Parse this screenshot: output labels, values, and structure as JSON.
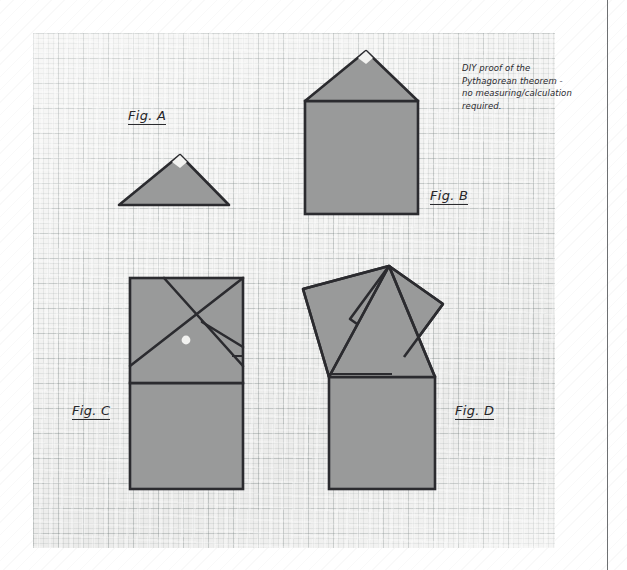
{
  "page": {
    "title": "DIY proof of the Pythagorean theorem",
    "medium": "graph paper sketch",
    "paper_color": "#f3f3f2",
    "ink_color": "#26262a",
    "shape_fill": "#999a9a",
    "shape_stroke": "#2b2b2f"
  },
  "note": {
    "line1": "DIY proof of the",
    "line2": "Pythagorean theorem -",
    "line3": "no measuring/calculation",
    "line4": "required."
  },
  "figures": [
    {
      "id": "A",
      "label": "Fig. A",
      "caption": "right triangle",
      "description": "A single right triangle with a small square right-angle marker at its apex.",
      "label_x": 128,
      "label_y": 108
    },
    {
      "id": "B",
      "label": "Fig. B",
      "caption": "square on the hypotenuse",
      "description": "The same right triangle sitting on top of a square drawn on its hypotenuse, forming a house shape.",
      "label_x": 430,
      "label_y": 188
    },
    {
      "id": "C",
      "label": "Fig. C",
      "caption": "four copies tiling the hypotenuse square",
      "description": "The hypotenuse square subdivided by a pinwheel of four congruent copies of the triangle, above a tall rectangle.",
      "label_x": 72,
      "label_y": 403
    },
    {
      "id": "D",
      "label": "Fig. D",
      "caption": "squares on the two legs",
      "description": "The right triangle with a square erected on each of its two legs, above the square on the hypotenuse.",
      "label_x": 455,
      "label_y": 403
    }
  ]
}
